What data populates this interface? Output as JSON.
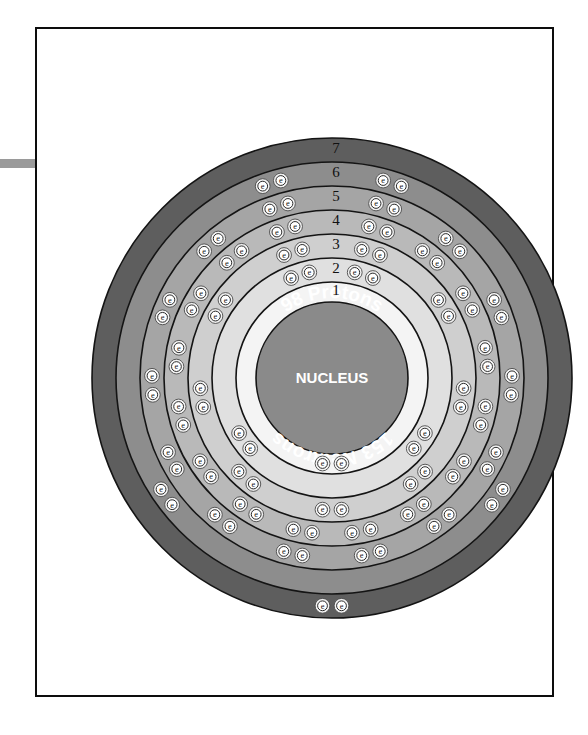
{
  "page": {
    "background_color": "#ffffff",
    "border_color": "#0d0d0d",
    "left_bar_color": "#9a9a9a"
  },
  "nucleus": {
    "protons_label": "98 Protons",
    "center_label": "NUCLEUS",
    "neutrons_label": "153 Neutrons",
    "fill_color": "#8a8a8a",
    "text_color": "#ffffff"
  },
  "electron_glyph": "e",
  "chart_data": {
    "type": "diagram",
    "element": {
      "protons": 98,
      "neutrons": 153,
      "mass_number": 251
    },
    "shell_labels": [
      "1",
      "2",
      "3",
      "4",
      "5",
      "6",
      "7"
    ],
    "electron_configuration": [
      2,
      8,
      18,
      32,
      28,
      8,
      2
    ],
    "shells": [
      {
        "number": "1",
        "electrons": 2,
        "fill": "#f4f4f4",
        "outer_radius": 96,
        "inner_radius": 76
      },
      {
        "number": "2",
        "electrons": 8,
        "fill": "#e0e0e0",
        "outer_radius": 120,
        "inner_radius": 96
      },
      {
        "number": "3",
        "electrons": 18,
        "fill": "#cfcfcf",
        "outer_radius": 144,
        "inner_radius": 120
      },
      {
        "number": "4",
        "electrons": 32,
        "fill": "#b9b9b9",
        "outer_radius": 168,
        "inner_radius": 144
      },
      {
        "number": "5",
        "electrons": 28,
        "fill": "#a5a5a5",
        "outer_radius": 192,
        "inner_radius": 168
      },
      {
        "number": "6",
        "electrons": 8,
        "fill": "#8d8d8d",
        "outer_radius": 216,
        "inner_radius": 192
      },
      {
        "number": "7",
        "electrons": 2,
        "fill": "#5e5e5e",
        "outer_radius": 240,
        "inner_radius": 216
      }
    ],
    "legend_position": "none",
    "grid": false
  }
}
